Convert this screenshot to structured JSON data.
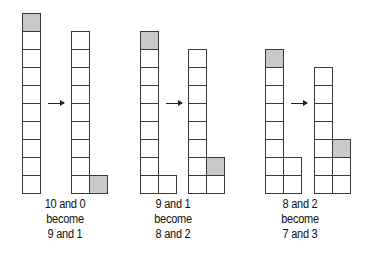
{
  "diagram": {
    "cell_size": 18,
    "colors": {
      "filled": "#c9c9c9",
      "empty": "#ffffff",
      "stroke": "#3a3a3a"
    },
    "groups": [
      {
        "before": {
          "left": 10,
          "right": 0
        },
        "after": {
          "left": 9,
          "right": 1
        },
        "caption": [
          "10 and 0",
          "become",
          "9 and 1"
        ]
      },
      {
        "before": {
          "left": 9,
          "right": 1
        },
        "after": {
          "left": 8,
          "right": 2
        },
        "caption": [
          "9 and 1",
          "become",
          "8 and 2"
        ]
      },
      {
        "before": {
          "left": 8,
          "right": 2
        },
        "after": {
          "left": 7,
          "right": 3
        },
        "caption": [
          "8 and 2",
          "become",
          "7 and 3"
        ]
      }
    ]
  }
}
